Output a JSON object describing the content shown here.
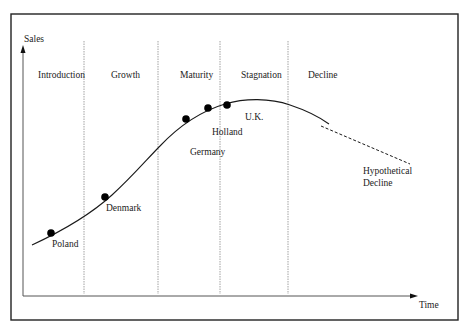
{
  "diagram": {
    "axes": {
      "y_label": "Sales",
      "x_label": "Time"
    },
    "stages": [
      {
        "label": "Introduction"
      },
      {
        "label": "Growth"
      },
      {
        "label": "Maturity"
      },
      {
        "label": "Stagnation"
      },
      {
        "label": "Decline"
      }
    ],
    "countries": [
      {
        "label": "Poland"
      },
      {
        "label": "Denmark"
      },
      {
        "label": "Germany"
      },
      {
        "label": "Holland"
      },
      {
        "label": "U.K."
      }
    ],
    "hypothetical": {
      "line1": "Hypothetical",
      "line2": "Decline"
    },
    "colors": {
      "line": "#1a1a1a",
      "divider": "#8a8a8a",
      "frame": "#222222",
      "text": "#222222"
    }
  }
}
